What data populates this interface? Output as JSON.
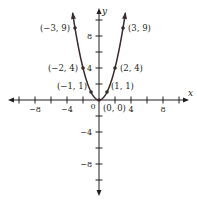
{
  "chart_data": {
    "type": "line",
    "title": "",
    "function": "y = x^2",
    "xlabel": "x",
    "ylabel": "y",
    "xlim": [
      -11,
      11
    ],
    "ylim": [
      -12,
      12
    ],
    "x_tick_step": 2,
    "y_tick_step": 2,
    "x_tick_labels": [
      {
        "value": -8,
        "label": "−8"
      },
      {
        "value": -4,
        "label": "−4"
      },
      {
        "value": 4,
        "label": "4"
      },
      {
        "value": 8,
        "label": "8"
      }
    ],
    "y_tick_labels": [
      {
        "value": 8,
        "label": "8"
      },
      {
        "value": 4,
        "label": "4"
      },
      {
        "value": -4,
        "label": "−4"
      },
      {
        "value": -8,
        "label": "−8"
      }
    ],
    "origin_label": "0",
    "grid": false,
    "legend": null,
    "series": [
      {
        "name": "y = x^2",
        "x": [
          -3.3,
          -3,
          -2,
          -1,
          0,
          1,
          2,
          3,
          3.3
        ],
        "y": [
          10.89,
          9,
          4,
          1,
          0,
          1,
          4,
          9,
          10.89
        ],
        "color": "#3a2a2a"
      }
    ],
    "points": [
      {
        "x": -3,
        "y": 9,
        "label": "(−3, 9)"
      },
      {
        "x": 3,
        "y": 9,
        "label": "(3, 9)"
      },
      {
        "x": -2,
        "y": 4,
        "label": "(−2, 4)"
      },
      {
        "x": 2,
        "y": 4,
        "label": "(2, 4)"
      },
      {
        "x": -1,
        "y": 1,
        "label": "(−1, 1)"
      },
      {
        "x": 1,
        "y": 1,
        "label": "(1, 1)"
      },
      {
        "x": 0,
        "y": 0,
        "label": "(0, 0)"
      }
    ]
  },
  "colors": {
    "axis": "#231f20",
    "curve": "#3a2a2a",
    "background": "#ffffff"
  }
}
